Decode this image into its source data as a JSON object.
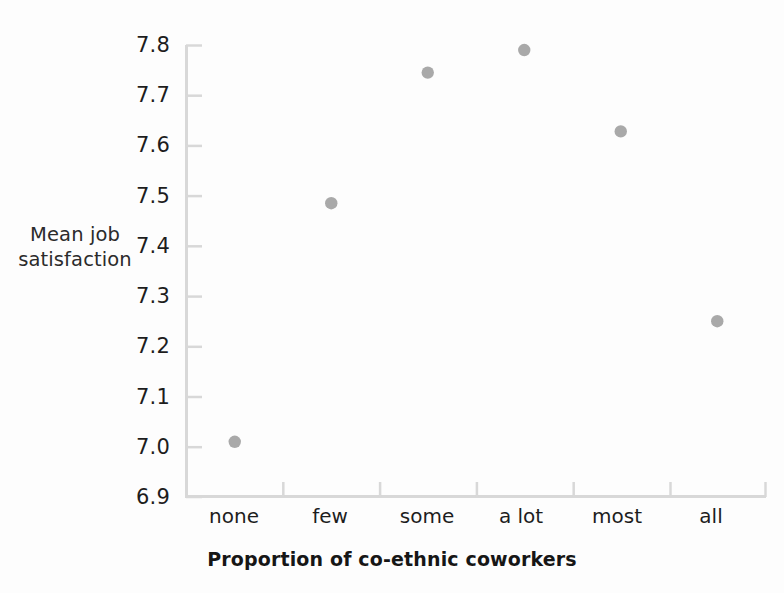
{
  "chart_data": {
    "type": "scatter",
    "title": "",
    "xlabel": "Proportion of co-ethnic coworkers",
    "ylabel": "Mean job satisfaction",
    "ylabel_lines": [
      "Mean job",
      "satisfaction"
    ],
    "categories": [
      "none",
      "few",
      "some",
      "a lot",
      "most",
      "all"
    ],
    "values": [
      7.01,
      7.485,
      7.745,
      7.79,
      7.628,
      7.25
    ],
    "series": [
      {
        "name": "Mean job satisfaction",
        "values": [
          7.01,
          7.485,
          7.745,
          7.79,
          7.628,
          7.25
        ]
      }
    ],
    "points": [
      {
        "x": "none",
        "y": 7.01
      },
      {
        "x": "few",
        "y": 7.485
      },
      {
        "x": "some",
        "y": 7.745
      },
      {
        "x": "a lot",
        "y": 7.79
      },
      {
        "x": "most",
        "y": 7.628
      },
      {
        "x": "all",
        "y": 7.25
      }
    ],
    "ylim": [
      6.9,
      7.8
    ],
    "ytick_labels": [
      "7.8",
      "7.7",
      "7.6",
      "7.5",
      "7.4",
      "7.3",
      "7.2",
      "7.1",
      "7.0",
      "6.9"
    ],
    "ytick_values": [
      7.8,
      7.7,
      7.6,
      7.5,
      7.4,
      7.3,
      7.2,
      7.1,
      7.0,
      6.9
    ],
    "grid": false,
    "legend": "none",
    "marker_color": "#a9a9a9",
    "axis_color": "#d6d6d6",
    "text_color": "#1d1d1d",
    "background_color": "#fdfdfd"
  },
  "axis": {
    "y_title_line1": "Mean job",
    "y_title_line2": "satisfaction",
    "x_title": "Proportion of co-ethnic coworkers",
    "y_labels": [
      "7.8",
      "7.7",
      "7.6",
      "7.5",
      "7.4",
      "7.3",
      "7.2",
      "7.1",
      "7.0",
      "6.9"
    ],
    "x_labels": [
      "none",
      "few",
      "some",
      "a lot",
      "most",
      "all"
    ]
  }
}
